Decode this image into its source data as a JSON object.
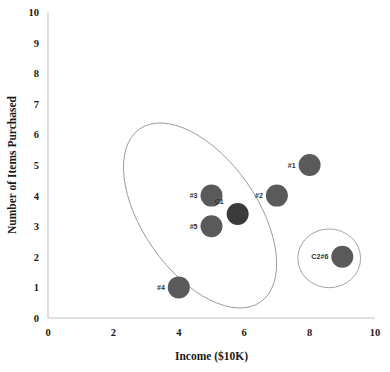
{
  "chart_data": {
    "type": "scatter",
    "title": "",
    "xlabel": "Income ($10K)",
    "ylabel": "Number of Items Purchased",
    "xlim": [
      0,
      10
    ],
    "ylim": [
      0,
      10
    ],
    "xticks": [
      "0",
      "2",
      "4",
      "6",
      "8",
      "10"
    ],
    "xtick_values": [
      0,
      2,
      4,
      6,
      8,
      10
    ],
    "yticks": [
      "0",
      "1",
      "2",
      "3",
      "4",
      "5",
      "6",
      "7",
      "8",
      "9",
      "10"
    ],
    "ytick_values": [
      0,
      1,
      2,
      3,
      4,
      5,
      6,
      7,
      8,
      9,
      10
    ],
    "grid": false,
    "legend": "none",
    "marker_color": "#5a5a5a",
    "centroid_color": "#3a3a3a",
    "outline_color": "#9a9a9a",
    "points": [
      {
        "label": "#1",
        "x": 8,
        "y": 5,
        "kind": "data",
        "label_pos": "left"
      },
      {
        "label": "#2",
        "x": 7,
        "y": 4,
        "kind": "data",
        "label_pos": "left"
      },
      {
        "label": "#3",
        "x": 5,
        "y": 4,
        "kind": "data",
        "label_pos": "left"
      },
      {
        "label": "#4",
        "x": 4,
        "y": 1,
        "kind": "data",
        "label_pos": "left"
      },
      {
        "label": "#5",
        "x": 5,
        "y": 3,
        "kind": "data",
        "label_pos": "left"
      },
      {
        "label": "#6",
        "x": 9,
        "y": 2,
        "kind": "data",
        "label_pos": "left"
      },
      {
        "label": "C1",
        "x": 5.8,
        "y": 3.4,
        "kind": "centroid",
        "label_pos": "left"
      },
      {
        "label": "C2",
        "x": 9,
        "y": 2,
        "kind": "centroid-label-only",
        "label_pos": "left"
      }
    ],
    "clusters": [
      {
        "name": "C1",
        "shape": "ellipse",
        "cx": 4.65,
        "cy": 3.35,
        "rx": 1.75,
        "ry": 3.45,
        "rotation": -35
      },
      {
        "name": "C2",
        "shape": "circle",
        "cx": 8.6,
        "cy": 1.95,
        "rx": 0.96,
        "ry": 0.96,
        "rotation": 0
      }
    ]
  }
}
